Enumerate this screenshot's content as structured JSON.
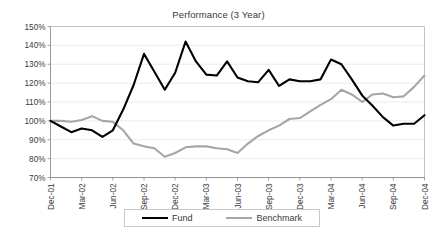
{
  "chart_data": {
    "type": "line",
    "title": "Performance (3 Year)",
    "xlabel": "",
    "ylabel": "",
    "ylim": [
      70,
      150
    ],
    "ytick_labels": [
      "150%",
      "140%",
      "130%",
      "120%",
      "110%",
      "100%",
      "90%",
      "80%",
      "70%"
    ],
    "ytick_values": [
      150,
      140,
      130,
      120,
      110,
      100,
      90,
      80,
      70
    ],
    "grid": true,
    "legend_position": "bottom",
    "x": [
      "Dec-01",
      "Jan-02",
      "Feb-02",
      "Mar-02",
      "Apr-02",
      "May-02",
      "Jun-02",
      "Jul-02",
      "Aug-02",
      "Sep-02",
      "Oct-02",
      "Nov-02",
      "Dec-02",
      "Jan-03",
      "Feb-03",
      "Mar-03",
      "Apr-03",
      "May-03",
      "Jun-03",
      "Jul-03",
      "Aug-03",
      "Sep-03",
      "Oct-03",
      "Nov-03",
      "Dec-03",
      "Jan-04",
      "Feb-04",
      "Mar-04",
      "Apr-04",
      "May-04",
      "Jun-04",
      "Jul-04",
      "Aug-04",
      "Sep-04",
      "Oct-04",
      "Nov-04",
      "Dec-04"
    ],
    "xtick_labels": [
      "Dec-01",
      "Mar-02",
      "Jun-02",
      "Sep-02",
      "Dec-02",
      "Mar-03",
      "Jun-03",
      "Sep-03",
      "Dec-03",
      "Mar-04",
      "Jun-04",
      "Sep-04",
      "Dec-04"
    ],
    "xtick_indices": [
      0,
      3,
      6,
      9,
      12,
      15,
      18,
      21,
      24,
      27,
      30,
      33,
      36
    ],
    "series": [
      {
        "name": "Fund",
        "color": "#000000",
        "values": [
          100.0,
          97.0,
          94.0,
          96.0,
          95.0,
          91.5,
          95.0,
          106.0,
          119.0,
          135.5,
          126.0,
          116.5,
          125.5,
          142.0,
          131.5,
          124.5,
          124.0,
          131.5,
          123.0,
          121.0,
          120.5,
          127.0,
          118.5,
          122.0,
          121.0,
          121.0,
          122.0,
          132.5,
          130.0,
          122.0,
          113.5,
          108.0,
          102.0,
          97.5,
          98.5,
          98.5,
          103.0
        ]
      },
      {
        "name": "Benchmark",
        "color": "#A6A6A6",
        "values": [
          100.0,
          100.0,
          99.5,
          100.5,
          102.5,
          100.0,
          99.5,
          95.0,
          88.0,
          86.5,
          85.5,
          81.0,
          83.0,
          86.0,
          86.5,
          86.5,
          85.5,
          85.0,
          83.0,
          88.0,
          92.0,
          95.0,
          97.5,
          101.0,
          101.5,
          105.0,
          108.5,
          111.5,
          116.5,
          114.0,
          110.0,
          114.0,
          114.5,
          112.5,
          113.0,
          118.0,
          124.0
        ]
      }
    ]
  },
  "legend": {
    "entries": [
      {
        "label": "Fund"
      },
      {
        "label": "Benchmark"
      }
    ]
  },
  "colors": {
    "fund": "#000000",
    "benchmark": "#A6A6A6",
    "grid": "#E4E4E4",
    "axis": "#8C8C8C",
    "text": "#3A3A3A",
    "background": "#FFFFFF"
  }
}
